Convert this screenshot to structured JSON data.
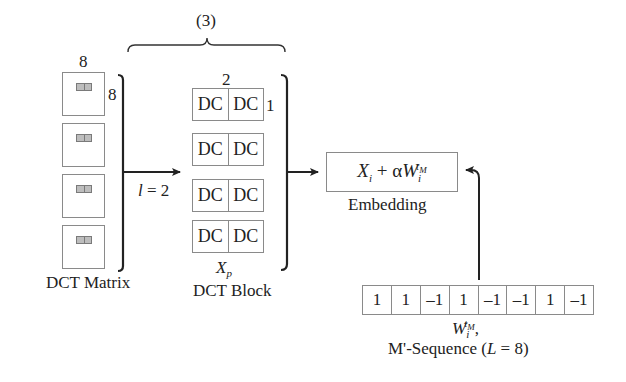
{
  "top_brace": {
    "label": "(3)"
  },
  "dct_matrix": {
    "width_label": "8",
    "height_label": "8",
    "block_count": 4,
    "caption": "DCT Matrix"
  },
  "selection": {
    "label_var": "l",
    "label_rest": " = 2"
  },
  "dct_block": {
    "width_label": "2",
    "height_label": "1",
    "rows": [
      [
        "DC",
        "DC"
      ],
      [
        "DC",
        "DC"
      ],
      [
        "DC",
        "DC"
      ],
      [
        "DC",
        "DC"
      ]
    ],
    "symbol": "X",
    "symbol_sub": "p",
    "caption": "DCT Block"
  },
  "embedding": {
    "formula_x": "X",
    "formula_x_sub": "i",
    "formula_op": " + α",
    "formula_w": "W",
    "formula_w_sub": "i",
    "formula_w_sup": "t",
    "formula_w_sup_sub": "M",
    "caption": "Embedding"
  },
  "m_sequence": {
    "values": [
      "1",
      "1",
      "–1",
      "1",
      "–1",
      "–1",
      "1",
      "–1"
    ],
    "symbol": "W",
    "symbol_sub": "i",
    "symbol_sup": "t",
    "symbol_sup_sub": "M",
    "symbol_suffix": ",",
    "caption_prefix": "M'-Sequence (",
    "caption_var": "L",
    "caption_suffix": " = 8)"
  },
  "colors": {
    "line": "#222222",
    "box_border": "#8a8a8a",
    "tile_fill": "#bdbdbd"
  }
}
